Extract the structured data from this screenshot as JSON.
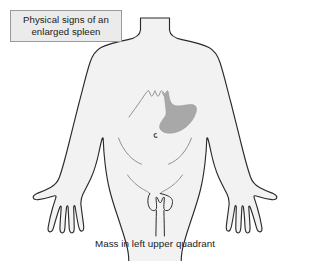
{
  "figure": {
    "alt_label": "anatomical front view torso with enlarged spleen highlighted",
    "background_color": "#ffffff"
  },
  "title_box": {
    "line1": "Physical signs of an",
    "line2": "enlarged spleen",
    "fill_color": "#ebebeb",
    "border_color": "#9a9a9a",
    "text_color": "#1a1a1a"
  },
  "caption": {
    "text": "Mass in left upper quadrant",
    "text_color": "#1a1a1a"
  },
  "anatomy": {
    "body_fill_color": "#f2f2f2",
    "body_outline_color": "#2b2b2b",
    "detail_line_color": "#8c8c8c",
    "spleen_fill_color": "#a8a8a8",
    "spleen_outline_color": "#9b9b9b",
    "parts": [
      {
        "name": "torso-outline",
        "label": "Torso"
      },
      {
        "name": "left-arm",
        "label": "Left arm"
      },
      {
        "name": "right-arm",
        "label": "Right arm"
      },
      {
        "name": "left-hand",
        "label": "Left hand"
      },
      {
        "name": "right-hand",
        "label": "Right hand"
      },
      {
        "name": "costal-margin",
        "label": "Costal margin"
      },
      {
        "name": "navel",
        "label": "Navel"
      },
      {
        "name": "iliac-crest-left",
        "label": "Left iliac crest"
      },
      {
        "name": "iliac-crest-right",
        "label": "Right iliac crest"
      },
      {
        "name": "inguinal-fold",
        "label": "Inguinal fold"
      },
      {
        "name": "spleen-mass",
        "label": "Enlarged spleen"
      }
    ]
  }
}
